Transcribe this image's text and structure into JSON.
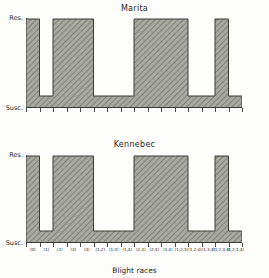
{
  "axis": {
    "x_title": "Blight races",
    "y_top_label": "Res.",
    "y_bottom_label": "Susc."
  },
  "panels": [
    {
      "id": "marita",
      "title": "Marita"
    },
    {
      "id": "kennebec",
      "title": "Kennebec"
    }
  ],
  "chart_data": {
    "type": "bar",
    "xlabel": "Blight races",
    "ylabel": "",
    "ylim": [
      0,
      1
    ],
    "ytick_labels": [
      "Susc.",
      "Res."
    ],
    "grid": false,
    "legend": "none",
    "categories": [
      "(0)",
      "(1)",
      "(2)",
      "(3)",
      "(4)",
      "(1,2)",
      "(1,3)",
      "(1,4)",
      "(2,3)",
      "(2,4)",
      "(3,4)",
      "(1,2,3)",
      "(1,2,4)",
      "(1,3,4)",
      "(1,2,3,4)",
      "(1,2,3,4)"
    ],
    "series": [
      {
        "name": "Marita",
        "values": [
          1,
          0,
          1,
          1,
          1,
          0,
          0,
          0,
          1,
          1,
          1,
          1,
          0,
          0,
          1,
          0
        ],
        "note": "1 = Res. (resistant), 0 = Susc. (susceptible)"
      },
      {
        "name": "Kennebec",
        "values": [
          1,
          0,
          1,
          1,
          1,
          0,
          0,
          0,
          1,
          1,
          1,
          1,
          0,
          0,
          1,
          0
        ],
        "note": "1 = Res. (resistant), 0 = Susc. (susceptible)"
      }
    ]
  }
}
